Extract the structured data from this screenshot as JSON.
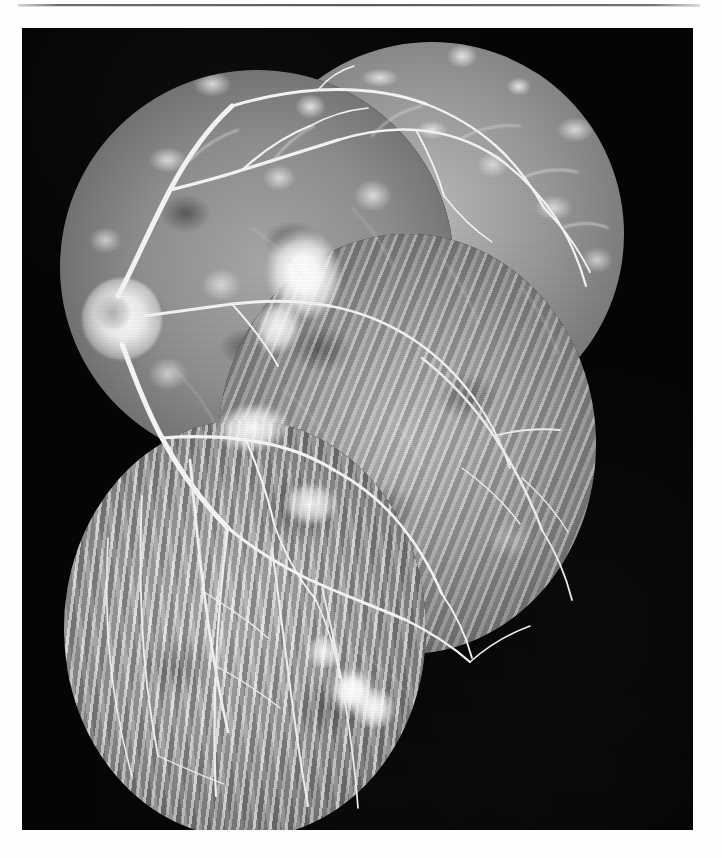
{
  "page": {
    "background_color": "#ffffff",
    "has_header_rule": true
  },
  "figure": {
    "name": "fluorescein-angiogram-montage",
    "plate_background_color": "#050505",
    "modality": "fluorescein angiogram",
    "laterality_landmark": "optic disc visible at left of montage",
    "frame_count": 4,
    "frames": [
      {
        "id": "superior-nasal",
        "label": "superior nasal frame",
        "contains": "optic disc, major retinal arcades"
      },
      {
        "id": "superior-temporal",
        "label": "superior temporal frame",
        "contains": "mottled choroidal background, fine vessel branches"
      },
      {
        "id": "inferior-temporal",
        "label": "inferior temporal frame",
        "contains": "streaky choroidal pattern, peripheral vessels"
      },
      {
        "id": "inferior",
        "label": "inferior frame",
        "contains": "bright linear choroidal streaks, hyperfluorescent rings"
      }
    ],
    "findings": [
      {
        "id": "optic-disc",
        "label": "optic disc"
      },
      {
        "id": "macular-hyperfluorescence",
        "label": "central hyperfluorescent leakage"
      },
      {
        "id": "paramacular-hyperfluorescence",
        "label": "paramacular hyperfluorescence"
      },
      {
        "id": "inferior-ring-lesions",
        "label": "ring-shaped hyperfluorescent lesions"
      }
    ]
  },
  "colors": {
    "plate": "#050505",
    "page": "#ffffff",
    "rule": "#5a5a5a",
    "highlight": "#ffffff"
  }
}
